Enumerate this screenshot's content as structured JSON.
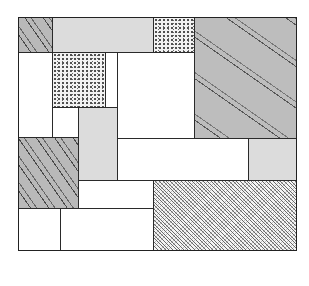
{
  "diagram": {
    "type": "rectangle-partition-composition",
    "frame": {
      "x": 18,
      "y": 17,
      "w": 278,
      "h": 233
    },
    "colors": {
      "line": "#2a2a2a",
      "white": "#ffffff",
      "light": "#dcdcdc",
      "gray": "#bdbdbd"
    },
    "cells": [
      {
        "id": "top-left-hatched",
        "fill": "hatch",
        "x": 18,
        "y": 17,
        "w": 34,
        "h": 35
      },
      {
        "id": "top-light",
        "fill": "light",
        "x": 52,
        "y": 17,
        "w": 101,
        "h": 35
      },
      {
        "id": "top-stipple",
        "fill": "stipple",
        "x": 153,
        "y": 17,
        "w": 41,
        "h": 35
      },
      {
        "id": "right-diagonal",
        "fill": "diag",
        "x": 194,
        "y": 17,
        "w": 102,
        "h": 121
      },
      {
        "id": "left-white-column",
        "fill": "white",
        "x": 18,
        "y": 52,
        "w": 34,
        "h": 85
      },
      {
        "id": "middle-stipple",
        "fill": "stipple",
        "x": 52,
        "y": 52,
        "w": 53,
        "h": 55
      },
      {
        "id": "narrow-white-column",
        "fill": "white",
        "x": 105,
        "y": 52,
        "w": 12,
        "h": 55
      },
      {
        "id": "center-white",
        "fill": "white",
        "x": 117,
        "y": 52,
        "w": 77,
        "h": 86
      },
      {
        "id": "small-white",
        "fill": "white",
        "x": 52,
        "y": 107,
        "w": 26,
        "h": 30
      },
      {
        "id": "middle-light",
        "fill": "light",
        "x": 78,
        "y": 107,
        "w": 39,
        "h": 73
      },
      {
        "id": "left-hatched",
        "fill": "hatch",
        "x": 18,
        "y": 137,
        "w": 60,
        "h": 71
      },
      {
        "id": "long-white",
        "fill": "white",
        "x": 117,
        "y": 138,
        "w": 131,
        "h": 42
      },
      {
        "id": "right-light",
        "fill": "light",
        "x": 248,
        "y": 138,
        "w": 48,
        "h": 42
      },
      {
        "id": "lower-white",
        "fill": "white",
        "x": 78,
        "y": 180,
        "w": 75,
        "h": 28
      },
      {
        "id": "bottom-right-dense",
        "fill": "dense",
        "x": 153,
        "y": 180,
        "w": 143,
        "h": 70
      },
      {
        "id": "bottom-left-white",
        "fill": "white",
        "x": 18,
        "y": 208,
        "w": 42,
        "h": 42
      },
      {
        "id": "bottom-middle-white",
        "fill": "white",
        "x": 60,
        "y": 208,
        "w": 93,
        "h": 42
      }
    ]
  }
}
